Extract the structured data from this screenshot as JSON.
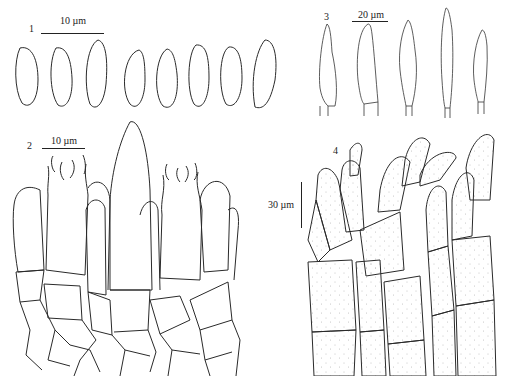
{
  "figure": {
    "panels": [
      {
        "id": "1",
        "label": "1",
        "subject": "basidiospores",
        "scale_bar": "10 µm",
        "count": 8
      },
      {
        "id": "2",
        "label": "2",
        "subject": "basidia and hymenium",
        "scale_bar": "10 µm"
      },
      {
        "id": "3",
        "label": "3",
        "subject": "cystidia",
        "scale_bar": "20 µm",
        "count": 5
      },
      {
        "id": "4",
        "label": "4",
        "subject": "pileipellis / hyphal cells",
        "scale_bar": "30 µm"
      }
    ],
    "colors": {
      "line": "#2a2a2a",
      "stipple": "#bdbdbd",
      "background": "#ffffff"
    }
  }
}
